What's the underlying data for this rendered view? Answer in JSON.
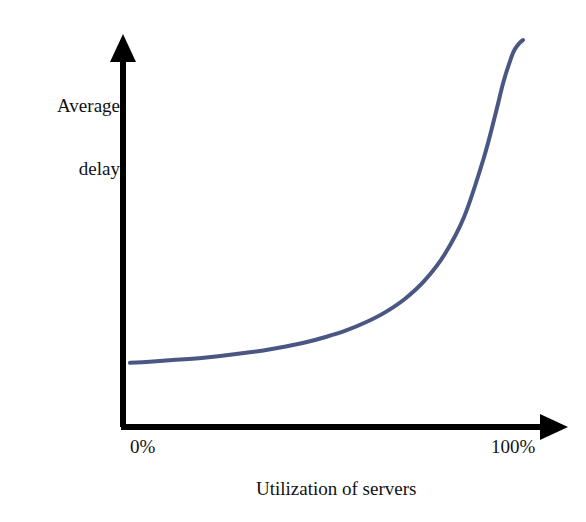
{
  "chart_data": {
    "type": "line",
    "title": "",
    "subtitle": "",
    "xlabel": "Utilization of servers",
    "ylabel": "Average delay",
    "ylabel_lines": [
      "Average",
      "delay"
    ],
    "xtick_labels": [
      "0%",
      "100%"
    ],
    "ytick_labels": [],
    "xlim": [
      0,
      100
    ],
    "ylim": [
      0,
      1
    ],
    "grid": false,
    "legend": null,
    "axis_style": "arrow-axes",
    "annotations": [],
    "series": [
      {
        "name": "Average delay vs utilization",
        "color": "#4a5684",
        "line_width": 4,
        "x": [
          0,
          5,
          10,
          15,
          20,
          25,
          30,
          35,
          40,
          45,
          50,
          55,
          60,
          65,
          70,
          75,
          80,
          85,
          90,
          93,
          95,
          97,
          98,
          99,
          100
        ],
        "y": [
          0.083,
          0.086,
          0.09,
          0.094,
          0.099,
          0.105,
          0.112,
          0.12,
          0.13,
          0.142,
          0.157,
          0.175,
          0.198,
          0.227,
          0.265,
          0.317,
          0.39,
          0.497,
          0.664,
          0.79,
          0.88,
          0.95,
          0.975,
          0.99,
          1.0
        ]
      }
    ]
  },
  "labels": {
    "y_axis_line1": "Average",
    "y_axis_line2": "delay",
    "x_tick_left": "0%",
    "x_tick_right": "100%",
    "x_axis_title": "Utilization of servers"
  },
  "colors": {
    "curve": "#4a5684",
    "axis": "#000000",
    "text": "#111111",
    "background": "#ffffff"
  }
}
